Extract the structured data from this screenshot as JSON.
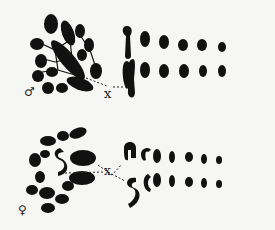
{
  "figure": {
    "panels": [
      {
        "id": "male",
        "sex_symbol": "♂",
        "chromosome_label": "x"
      },
      {
        "id": "female",
        "sex_symbol": "♀",
        "chromosome_label": "x"
      }
    ]
  }
}
